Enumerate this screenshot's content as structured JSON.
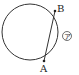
{
  "diagram": {
    "type": "circle-with-chord",
    "circle": {
      "cx": 30,
      "cy": 32,
      "r": 28,
      "stroke": "#333333"
    },
    "points": [
      {
        "name": "A",
        "x": 44,
        "y": 61,
        "label": "A"
      },
      {
        "name": "B",
        "x": 55,
        "y": 11,
        "label": "B"
      }
    ],
    "chord": {
      "from": "A",
      "to": "B"
    },
    "arc_label": {
      "text": "ア",
      "circled": true,
      "x": 67,
      "y": 38
    }
  }
}
